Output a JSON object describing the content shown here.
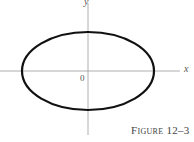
{
  "figure": {
    "caption": "Figure 12–3",
    "x_axis_label": "x",
    "y_axis_label": "y",
    "origin_label": "0"
  },
  "ellipse": {
    "center": [
      88,
      71
    ],
    "rx": 66,
    "ry": 39,
    "stroke": "#111111"
  },
  "axes_color": "#888888"
}
